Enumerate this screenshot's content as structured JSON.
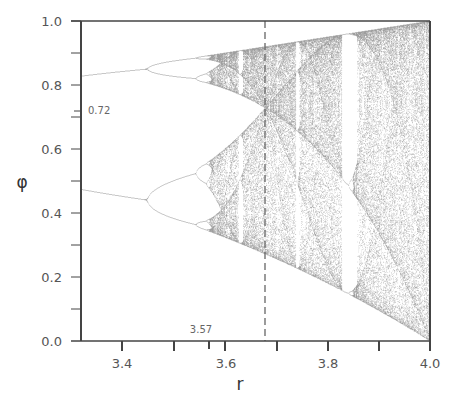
{
  "chart_data": {
    "type": "scatter",
    "xlabel": "r",
    "ylabel": "φ",
    "xlim": [
      3.32,
      4.0
    ],
    "ylim": [
      0.0,
      1.0
    ],
    "x_ticks": [
      "3.4",
      "3.6",
      "3.8",
      "4.0"
    ],
    "y_ticks": [
      "0.0",
      "0.2",
      "0.4",
      "0.6",
      "0.8",
      "1.0"
    ],
    "annotations": [
      {
        "text": "0.72",
        "axis": "y",
        "value": 0.72
      },
      {
        "text": "3.57",
        "axis": "x",
        "value": 3.57,
        "note": "onset of chaos"
      }
    ],
    "reference_line": {
      "orientation": "vertical",
      "r": 3.68,
      "style": "dashed"
    },
    "bifurcation_points": [
      {
        "r": 3.0,
        "branches": 2
      },
      {
        "r": 3.449,
        "branches": 4
      },
      {
        "r": 3.544,
        "branches": 8
      },
      {
        "r": 3.57,
        "branches": "chaos"
      }
    ],
    "period3_window_r": 3.83,
    "grid": false,
    "legend": null
  },
  "labels": {
    "xlabel": "r",
    "ylabel": "φ",
    "ann_y": "0.72",
    "ann_x": "3.57",
    "xt0": "3.4",
    "xt1": "3.6",
    "xt2": "3.8",
    "xt3": "4.0",
    "yt0": "0.0",
    "yt1": "0.2",
    "yt2": "0.4",
    "yt3": "0.6",
    "yt4": "0.8",
    "yt5": "1.0"
  }
}
